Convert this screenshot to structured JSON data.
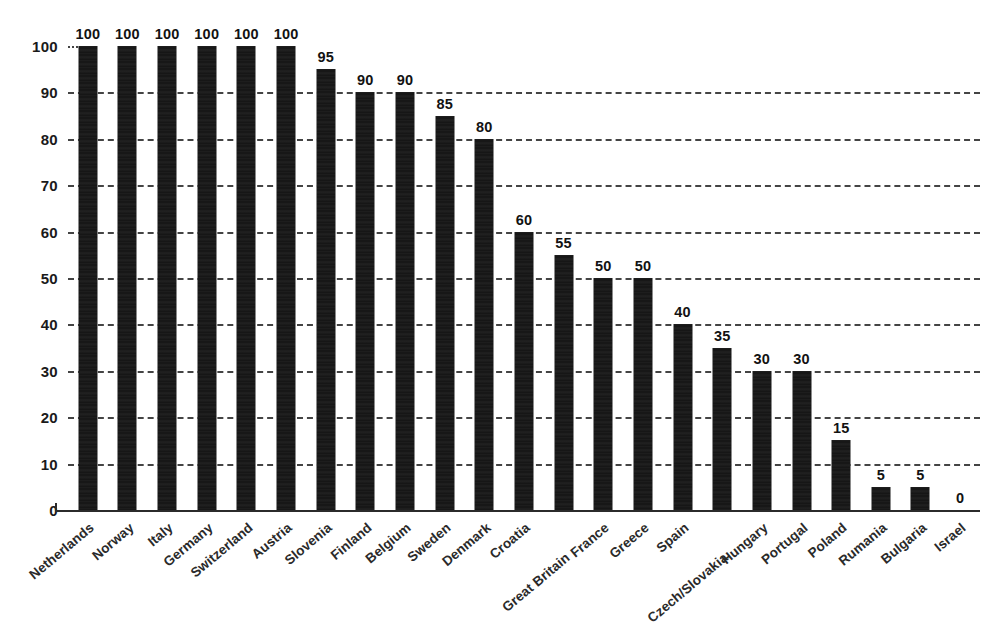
{
  "chart_data": {
    "type": "bar",
    "title": "",
    "subtitle": "",
    "xlabel": "",
    "ylabel": "",
    "ylim": [
      0,
      100
    ],
    "yticks": [
      0,
      10,
      20,
      30,
      40,
      50,
      60,
      70,
      80,
      90,
      100
    ],
    "ytick_labels": [
      "0",
      "10",
      "20",
      "30",
      "40",
      "50",
      "60",
      "70",
      "80",
      "90",
      "100"
    ],
    "grid": true,
    "grid_style": "dashed-horizontal",
    "legend": "none",
    "bar_color": "#141414",
    "background_color": "#ffffff",
    "value_labels": true,
    "xtick_rotation": -40,
    "categories": [
      "Netherlands",
      "Norway",
      "Italy",
      "Germany",
      "Switzerland",
      "Austria",
      "Slovenia",
      "Finland",
      "Belgium",
      "Sweden",
      "Denmark",
      "Croatia",
      "Great Britain",
      "France",
      "Greece",
      "Spain",
      "Czech/Slovakia",
      "Hungary",
      "Portugal",
      "Poland",
      "Rumania",
      "Bulgaria",
      "Israel"
    ],
    "values": [
      100,
      100,
      100,
      100,
      100,
      100,
      95,
      90,
      90,
      85,
      80,
      60,
      55,
      50,
      50,
      40,
      35,
      30,
      30,
      15,
      5,
      5,
      0
    ],
    "value_label_text": [
      "100",
      "100",
      "100",
      "100",
      "100",
      "100",
      "95",
      "90",
      "90",
      "85",
      "80",
      "60",
      "55",
      "50",
      "50",
      "40",
      "35",
      "30",
      "30",
      "15",
      "5",
      "5",
      "0"
    ],
    "staggered_labels": [
      "Great Britain",
      "Czech/Slovakia"
    ]
  }
}
